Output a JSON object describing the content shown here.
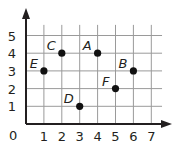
{
  "chart_data": {
    "type": "scatter",
    "title": "",
    "xlabel": "",
    "ylabel": "",
    "xlim": [
      0,
      7
    ],
    "ylim": [
      0,
      5
    ],
    "grid": true,
    "origin_label": "0",
    "x_ticks": [
      "1",
      "2",
      "3",
      "4",
      "5",
      "6",
      "7"
    ],
    "y_ticks": [
      "1",
      "2",
      "3",
      "4",
      "5"
    ],
    "points": [
      {
        "label": "A",
        "x": 4,
        "y": 4
      },
      {
        "label": "B",
        "x": 6,
        "y": 3
      },
      {
        "label": "C",
        "x": 2,
        "y": 4
      },
      {
        "label": "D",
        "x": 3,
        "y": 1
      },
      {
        "label": "E",
        "x": 1,
        "y": 3
      },
      {
        "label": "F",
        "x": 5,
        "y": 2
      }
    ],
    "colors": {
      "grid": "#9a9a9a",
      "axis": "#231f20",
      "point": "#111111"
    }
  }
}
